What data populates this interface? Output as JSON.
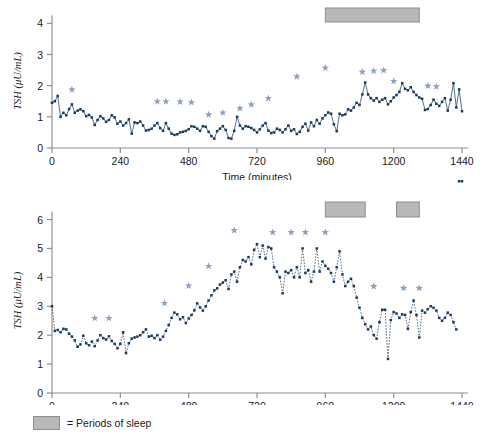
{
  "figure": {
    "legend": {
      "label": "= Periods of sleep",
      "swatch_color": "#b8b8b8",
      "swatch_border": "#8e8e8e"
    },
    "colors": {
      "marker": "#1a3a5c",
      "line": "#2b4a6f",
      "star": "#8da0c0",
      "axis": "#909090",
      "sleep_bar_fill": "#b8b8b8",
      "sleep_bar_border": "#8e8e8e"
    }
  },
  "chart_data": [
    {
      "id": "subject-a",
      "type": "line",
      "title": "",
      "xlabel": "Time (minutes)",
      "ylabel": "TSH (μU/mL)",
      "xlim": [
        0,
        1440
      ],
      "ylim": [
        0,
        4.3
      ],
      "xticks": [
        0,
        240,
        480,
        720,
        960,
        1200,
        1440
      ],
      "yticks": [
        0,
        1,
        2,
        3,
        4
      ],
      "grid": false,
      "legend_position": "none",
      "line_style": "solid",
      "marker": "square",
      "sleep_periods": [
        {
          "start": 960,
          "end": 1290
        }
      ],
      "pulse_markers": [
        {
          "x": 70,
          "y": 1.68
        },
        {
          "x": 370,
          "y": 1.3
        },
        {
          "x": 400,
          "y": 1.3
        },
        {
          "x": 450,
          "y": 1.29
        },
        {
          "x": 490,
          "y": 1.27
        },
        {
          "x": 550,
          "y": 0.88
        },
        {
          "x": 600,
          "y": 0.94
        },
        {
          "x": 660,
          "y": 1.08
        },
        {
          "x": 700,
          "y": 1.2
        },
        {
          "x": 760,
          "y": 1.4
        },
        {
          "x": 860,
          "y": 2.1
        },
        {
          "x": 960,
          "y": 2.38
        },
        {
          "x": 1090,
          "y": 2.25
        },
        {
          "x": 1130,
          "y": 2.28
        },
        {
          "x": 1165,
          "y": 2.3
        },
        {
          "x": 1200,
          "y": 1.95
        },
        {
          "x": 1320,
          "y": 1.8
        },
        {
          "x": 1350,
          "y": 1.78
        }
      ],
      "x": [
        0,
        10,
        20,
        30,
        40,
        50,
        60,
        70,
        80,
        90,
        100,
        110,
        120,
        130,
        140,
        150,
        160,
        170,
        180,
        190,
        200,
        210,
        220,
        230,
        240,
        250,
        260,
        270,
        280,
        290,
        300,
        310,
        320,
        330,
        340,
        350,
        360,
        370,
        380,
        390,
        400,
        410,
        420,
        430,
        440,
        450,
        460,
        470,
        480,
        490,
        500,
        510,
        520,
        530,
        540,
        550,
        560,
        570,
        580,
        590,
        600,
        610,
        620,
        630,
        640,
        650,
        660,
        670,
        680,
        690,
        700,
        710,
        720,
        730,
        740,
        750,
        760,
        770,
        780,
        790,
        800,
        810,
        820,
        830,
        840,
        850,
        860,
        870,
        880,
        890,
        900,
        910,
        920,
        930,
        940,
        950,
        960,
        970,
        980,
        990,
        1000,
        1010,
        1020,
        1030,
        1040,
        1050,
        1060,
        1070,
        1080,
        1090,
        1100,
        1110,
        1120,
        1130,
        1140,
        1150,
        1160,
        1170,
        1180,
        1190,
        1200,
        1210,
        1220,
        1230,
        1240,
        1250,
        1260,
        1270,
        1280,
        1290,
        1300,
        1310,
        1320,
        1330,
        1340,
        1350,
        1360,
        1370,
        1380,
        1390,
        1400,
        1410,
        1420,
        1430,
        1440
      ],
      "y": [
        1.45,
        1.5,
        1.67,
        1.0,
        1.13,
        1.05,
        1.25,
        1.4,
        1.13,
        1.2,
        1.24,
        1.18,
        1.02,
        1.06,
        0.98,
        0.74,
        0.9,
        1.02,
        0.95,
        0.84,
        0.9,
        1.05,
        0.98,
        0.78,
        0.85,
        0.72,
        0.8,
        0.92,
        0.46,
        0.82,
        0.8,
        0.85,
        0.72,
        0.56,
        0.58,
        0.62,
        0.72,
        0.8,
        0.64,
        0.55,
        0.8,
        0.62,
        0.46,
        0.42,
        0.44,
        0.5,
        0.52,
        0.55,
        0.6,
        0.7,
        0.68,
        0.62,
        0.55,
        0.7,
        0.68,
        0.52,
        0.38,
        0.3,
        0.54,
        0.62,
        0.7,
        0.58,
        0.32,
        0.3,
        0.55,
        1.0,
        0.72,
        0.62,
        0.7,
        0.68,
        0.64,
        0.58,
        0.5,
        0.6,
        0.72,
        0.8,
        0.56,
        0.48,
        0.5,
        0.62,
        0.58,
        0.5,
        0.6,
        0.72,
        0.55,
        0.6,
        0.45,
        0.52,
        0.68,
        0.78,
        0.56,
        0.82,
        0.7,
        0.9,
        0.78,
        0.95,
        1.05,
        1.14,
        1.1,
        0.76,
        0.54,
        1.1,
        1.05,
        1.08,
        1.24,
        1.2,
        1.3,
        1.45,
        1.38,
        1.72,
        2.1,
        1.72,
        1.6,
        1.52,
        1.6,
        1.48,
        1.55,
        1.6,
        1.4,
        1.5,
        1.62,
        1.7,
        1.8,
        2.08,
        1.9,
        1.85,
        1.95,
        1.8,
        1.7,
        1.62,
        1.58,
        1.22,
        1.25,
        1.38,
        1.55,
        1.42,
        1.35,
        1.48,
        1.6,
        1.2,
        1.55,
        2.08,
        1.3,
        1.88,
        1.18,
        1.8,
        1.0,
        0.95,
        1.42,
        1.38,
        1.32,
        1.3,
        1.28,
        1.28,
        1.3,
        1.25,
        1.26,
        1.24,
        0.65,
        1.05,
        1.55,
        1.4,
        1.45,
        1.2,
        0.98,
        0.8,
        0.62,
        0.66,
        0.62,
        0.6
      ]
    },
    {
      "id": "subject-b",
      "type": "line",
      "title": "",
      "xlabel": "Time (minutes)",
      "ylabel": "TSH (μU/mL)",
      "xlim": [
        0,
        1440
      ],
      "ylim": [
        0,
        6.4
      ],
      "xticks": [
        0,
        240,
        480,
        720,
        960,
        1200,
        1440
      ],
      "yticks": [
        0,
        1,
        2,
        3,
        4,
        5,
        6
      ],
      "grid": false,
      "legend_position": "none",
      "line_style": "dotted",
      "marker": "square",
      "sleep_periods": [
        {
          "start": 960,
          "end": 1100
        },
        {
          "start": 1210,
          "end": 1290
        }
      ],
      "pulse_markers": [
        {
          "x": 150,
          "y": 2.38
        },
        {
          "x": 200,
          "y": 2.38
        },
        {
          "x": 395,
          "y": 2.9
        },
        {
          "x": 480,
          "y": 3.5
        },
        {
          "x": 550,
          "y": 4.18
        },
        {
          "x": 640,
          "y": 5.42
        },
        {
          "x": 775,
          "y": 5.35
        },
        {
          "x": 840,
          "y": 5.35
        },
        {
          "x": 890,
          "y": 5.35
        },
        {
          "x": 960,
          "y": 5.35
        },
        {
          "x": 1130,
          "y": 3.48
        },
        {
          "x": 1235,
          "y": 3.42
        },
        {
          "x": 1290,
          "y": 3.42
        }
      ],
      "x": [
        0,
        10,
        20,
        30,
        40,
        50,
        60,
        70,
        80,
        90,
        100,
        110,
        120,
        130,
        140,
        150,
        160,
        170,
        180,
        190,
        200,
        210,
        220,
        230,
        240,
        250,
        260,
        270,
        280,
        290,
        300,
        310,
        320,
        330,
        340,
        350,
        360,
        370,
        380,
        390,
        400,
        410,
        420,
        430,
        440,
        450,
        460,
        470,
        480,
        490,
        500,
        510,
        520,
        530,
        540,
        550,
        560,
        570,
        580,
        590,
        600,
        610,
        620,
        630,
        640,
        650,
        660,
        670,
        680,
        690,
        700,
        710,
        720,
        730,
        740,
        750,
        760,
        770,
        780,
        790,
        800,
        810,
        820,
        830,
        840,
        850,
        860,
        870,
        880,
        890,
        900,
        910,
        920,
        930,
        940,
        950,
        960,
        970,
        980,
        990,
        1000,
        1010,
        1020,
        1030,
        1040,
        1050,
        1060,
        1070,
        1080,
        1090,
        1100,
        1110,
        1120,
        1130,
        1140,
        1150,
        1160,
        1170,
        1180,
        1190,
        1200,
        1210,
        1220,
        1230,
        1240,
        1250,
        1260,
        1270,
        1280,
        1290,
        1300,
        1310,
        1320,
        1330,
        1340,
        1350,
        1360,
        1370,
        1380,
        1390,
        1400,
        1410,
        1420,
        1430,
        1440
      ],
      "y": [
        3.0,
        2.15,
        2.18,
        2.1,
        2.22,
        2.2,
        2.05,
        1.95,
        1.82,
        1.6,
        1.68,
        1.98,
        1.72,
        1.65,
        1.78,
        1.62,
        1.82,
        2.0,
        1.9,
        1.85,
        1.96,
        1.8,
        1.7,
        1.55,
        1.7,
        2.1,
        1.38,
        1.72,
        1.88,
        1.92,
        1.95,
        2.0,
        2.1,
        2.2,
        1.95,
        1.98,
        1.9,
        2.0,
        1.84,
        1.95,
        2.15,
        2.35,
        2.6,
        2.78,
        2.72,
        2.55,
        2.62,
        2.42,
        2.58,
        2.7,
        2.86,
        3.1,
        2.96,
        2.85,
        3.0,
        3.2,
        3.38,
        3.55,
        3.62,
        3.75,
        3.82,
        3.9,
        3.6,
        4.1,
        4.2,
        3.85,
        4.35,
        4.6,
        4.55,
        4.7,
        4.45,
        4.95,
        5.15,
        4.7,
        5.1,
        4.65,
        5.05,
        5.0,
        4.35,
        4.2,
        4.0,
        3.45,
        4.2,
        4.15,
        4.25,
        4.0,
        4.35,
        4.0,
        5.0,
        4.15,
        4.25,
        3.85,
        4.2,
        5.0,
        4.2,
        4.55,
        4.4,
        4.3,
        4.15,
        3.85,
        4.35,
        4.9,
        4.1,
        3.7,
        3.85,
        3.95,
        3.7,
        3.3,
        2.95,
        2.6,
        2.38,
        2.2,
        2.3,
        2.0,
        1.88,
        2.45,
        2.88,
        2.88,
        1.18,
        2.52,
        2.8,
        2.75,
        2.6,
        2.72,
        2.7,
        2.22,
        2.8,
        3.2,
        2.7,
        1.92,
        2.85,
        2.78,
        2.9,
        3.0,
        2.95,
        2.85,
        2.6,
        2.5,
        2.6,
        2.78,
        2.7,
        2.45,
        2.2
      ]
    }
  ]
}
